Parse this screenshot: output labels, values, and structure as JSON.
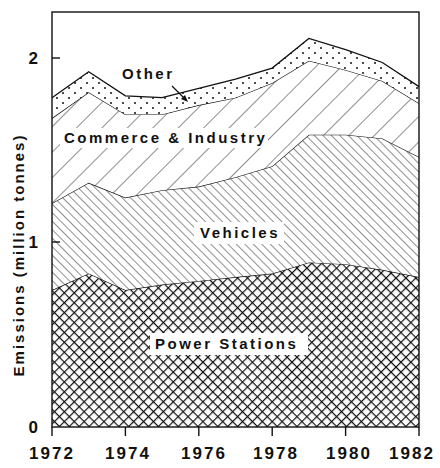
{
  "chart_data": {
    "type": "area",
    "stacked": true,
    "title": "",
    "xlabel": "",
    "ylabel": "Emissions (million tonnes)",
    "x": [
      1972,
      1973,
      1974,
      1975,
      1976,
      1977,
      1978,
      1979,
      1980,
      1981,
      1982
    ],
    "x_ticks": [
      "1972",
      "1974",
      "1976",
      "1978",
      "1980",
      "1982"
    ],
    "y_ticks": [
      "0",
      "1",
      "2"
    ],
    "xlim": [
      1972,
      1982
    ],
    "ylim": [
      0,
      2.2
    ],
    "grid": false,
    "legend_position": "inline labels",
    "series": [
      {
        "name": "Power Stations",
        "pattern": "crosshatch",
        "values": [
          0.74,
          0.83,
          0.74,
          0.77,
          0.79,
          0.81,
          0.83,
          0.89,
          0.88,
          0.85,
          0.81
        ]
      },
      {
        "name": "Vehicles",
        "pattern": "dense diagonal (\\)",
        "values": [
          0.47,
          0.49,
          0.5,
          0.51,
          0.51,
          0.54,
          0.58,
          0.69,
          0.7,
          0.71,
          0.65
        ]
      },
      {
        "name": "Commerce & Industry",
        "pattern": "sparse diagonal (/)",
        "values": [
          0.46,
          0.49,
          0.45,
          0.41,
          0.44,
          0.43,
          0.45,
          0.4,
          0.35,
          0.31,
          0.29
        ]
      },
      {
        "name": "Other",
        "pattern": "dots",
        "values": [
          0.11,
          0.11,
          0.1,
          0.09,
          0.09,
          0.1,
          0.08,
          0.12,
          0.11,
          0.1,
          0.09
        ]
      }
    ],
    "cumulative_tops": {
      "Power Stations": [
        0.74,
        0.83,
        0.74,
        0.77,
        0.79,
        0.81,
        0.83,
        0.89,
        0.88,
        0.85,
        0.81
      ],
      "Vehicles": [
        1.21,
        1.32,
        1.24,
        1.28,
        1.3,
        1.35,
        1.41,
        1.58,
        1.58,
        1.56,
        1.46
      ],
      "Commerce & Industry": [
        1.67,
        1.81,
        1.69,
        1.69,
        1.74,
        1.78,
        1.86,
        1.98,
        1.93,
        1.87,
        1.75
      ],
      "Other": [
        1.78,
        1.92,
        1.79,
        1.78,
        1.83,
        1.88,
        1.94,
        2.1,
        2.04,
        1.97,
        1.84
      ]
    },
    "annotations": [
      {
        "text": "Other",
        "arrow": true
      },
      {
        "text": "Commerce & Industry"
      },
      {
        "text": "Vehicles"
      },
      {
        "text": "Power Stations"
      }
    ]
  },
  "labels": {
    "ylabel": "Emissions (million tonnes)",
    "other": "Other",
    "commerce": "Commerce & Industry",
    "vehicles": "Vehicles",
    "power": "Power Stations",
    "x0": "1972",
    "x1": "1974",
    "x2": "1976",
    "x3": "1978",
    "x4": "1980",
    "x5": "1982",
    "y0": "0",
    "y1": "1",
    "y2": "2"
  }
}
